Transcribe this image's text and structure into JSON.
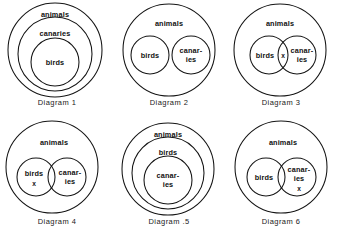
{
  "figure": {
    "title": "",
    "background_color": "#ffffff",
    "stroke_color": "#141414",
    "text_color": "#111111"
  },
  "labels": {
    "animals": "animals",
    "canaries_full": "canaries",
    "canaries_line1": "canar-",
    "canaries_line2": "ies",
    "birds": "birds",
    "x_mark": "x"
  },
  "diagrams": [
    {
      "id": "diagram-1",
      "caption": "Diagram 1",
      "layout": "nested-three",
      "sets": [
        "animals",
        "canaries",
        "birds"
      ],
      "x_mark": null
    },
    {
      "id": "diagram-2",
      "caption": "Diagram 2",
      "layout": "two-disjoint-inside-one",
      "sets": [
        "animals",
        "birds",
        "canaries"
      ],
      "x_mark": null
    },
    {
      "id": "diagram-3",
      "caption": "Diagram 3",
      "layout": "two-overlapping-inside-one",
      "sets": [
        "animals",
        "birds",
        "canaries"
      ],
      "x_mark": "intersection"
    },
    {
      "id": "diagram-4",
      "caption": "Diagram 4",
      "layout": "two-overlapping-inside-one",
      "sets": [
        "animals",
        "birds",
        "canaries"
      ],
      "x_mark": "birds-only"
    },
    {
      "id": "diagram-5",
      "caption": "Diagram .5",
      "layout": "nested-three",
      "sets": [
        "animals",
        "birds",
        "canaries"
      ],
      "x_mark": null
    },
    {
      "id": "diagram-6",
      "caption": "Diagram 6",
      "layout": "two-overlapping-inside-one",
      "sets": [
        "animals",
        "birds",
        "canaries"
      ],
      "x_mark": "canaries-only"
    }
  ]
}
